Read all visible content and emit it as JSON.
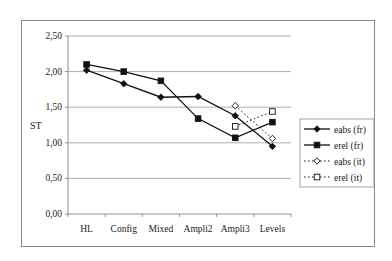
{
  "chart_data": {
    "type": "line",
    "title": "",
    "xlabel": "",
    "ylabel": "ST",
    "ylim": [
      0,
      2.5
    ],
    "yticks": [
      "0,00",
      "0,50",
      "1,00",
      "1,50",
      "2,00",
      "2,50"
    ],
    "grid": true,
    "legend_position": "right",
    "categories": [
      "HL",
      "Config",
      "Mixed",
      "Ampli2",
      "Ampli3",
      "Levels"
    ],
    "series": [
      {
        "name": "eabs (fr)",
        "style": "solid",
        "marker": "filled-diamond",
        "values": [
          2.02,
          1.83,
          1.64,
          1.65,
          1.38,
          0.95
        ]
      },
      {
        "name": "erel (fr)",
        "style": "solid",
        "marker": "filled-square",
        "values": [
          2.1,
          2.0,
          1.87,
          1.34,
          1.07,
          1.29
        ]
      },
      {
        "name": "eabs (it)",
        "style": "dotted",
        "marker": "open-diamond",
        "values": [
          null,
          null,
          null,
          null,
          1.52,
          1.06
        ]
      },
      {
        "name": "erel (it)",
        "style": "dotted",
        "marker": "open-square",
        "values": [
          null,
          null,
          null,
          null,
          1.23,
          1.44
        ]
      }
    ]
  }
}
